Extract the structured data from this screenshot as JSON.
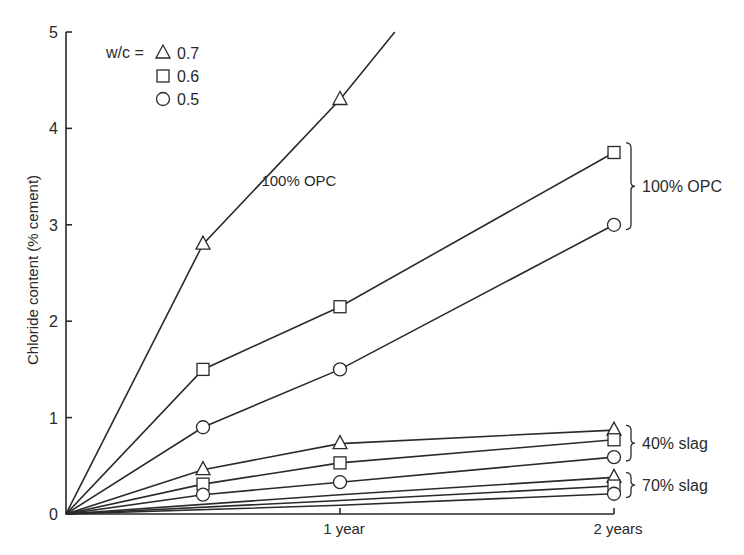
{
  "chart_data": {
    "type": "line",
    "title": "",
    "xlabel": "",
    "ylabel": "Chloride content (% cement)",
    "xlim": [
      0,
      2
    ],
    "ylim": [
      0,
      5
    ],
    "grid": false,
    "x_ticks": [
      {
        "value": 1,
        "label": "1 year"
      },
      {
        "value": 2,
        "label": "2 years"
      }
    ],
    "y_ticks": [
      {
        "value": 0,
        "label": "0"
      },
      {
        "value": 1,
        "label": "1"
      },
      {
        "value": 2,
        "label": "2"
      },
      {
        "value": 3,
        "label": "3"
      },
      {
        "value": 4,
        "label": "4"
      },
      {
        "value": 5,
        "label": "5"
      }
    ],
    "legend": {
      "position": "upper-left",
      "prefix": "w/c =",
      "entries": [
        {
          "marker": "triangle",
          "label": "0.7"
        },
        {
          "marker": "square",
          "label": "0.6"
        },
        {
          "marker": "circle",
          "label": "0.5"
        }
      ]
    },
    "series": [
      {
        "name": "100% OPC, w/c 0.7",
        "group": "100% OPC",
        "wc": "0.7",
        "marker": "triangle",
        "x": [
          0,
          0.5,
          1,
          1.2
        ],
        "y": [
          0,
          2.8,
          4.3,
          5.0
        ],
        "marker_points": [
          1,
          2
        ]
      },
      {
        "name": "100% OPC, w/c 0.6",
        "group": "100% OPC",
        "wc": "0.6",
        "marker": "square",
        "x": [
          0,
          0.5,
          1,
          2
        ],
        "y": [
          0,
          1.5,
          2.15,
          3.75
        ],
        "marker_points": [
          1,
          2,
          3
        ]
      },
      {
        "name": "100% OPC, w/c 0.5",
        "group": "100% OPC",
        "wc": "0.5",
        "marker": "circle",
        "x": [
          0,
          0.5,
          1,
          2
        ],
        "y": [
          0,
          0.9,
          1.5,
          3.0
        ],
        "marker_points": [
          1,
          2,
          3
        ]
      },
      {
        "name": "40% slag, w/c 0.7",
        "group": "40% slag",
        "wc": "0.7",
        "marker": "triangle",
        "x": [
          0,
          0.5,
          1,
          2
        ],
        "y": [
          0,
          0.46,
          0.73,
          0.87
        ],
        "marker_points": [
          1,
          2,
          3
        ]
      },
      {
        "name": "40% slag, w/c 0.6",
        "group": "40% slag",
        "wc": "0.6",
        "marker": "square",
        "x": [
          0,
          0.5,
          1,
          2
        ],
        "y": [
          0,
          0.31,
          0.53,
          0.77
        ],
        "marker_points": [
          1,
          2,
          3
        ]
      },
      {
        "name": "40% slag, w/c 0.5",
        "group": "40% slag",
        "wc": "0.5",
        "marker": "circle",
        "x": [
          0,
          0.5,
          1,
          2
        ],
        "y": [
          0,
          0.2,
          0.33,
          0.59
        ],
        "marker_points": [
          1,
          2,
          3
        ]
      },
      {
        "name": "70% slag, w/c 0.7",
        "group": "70% slag",
        "wc": "0.7",
        "marker": "triangle",
        "x": [
          0,
          1,
          2
        ],
        "y": [
          0,
          0.2,
          0.38
        ],
        "marker_points": [
          2
        ]
      },
      {
        "name": "70% slag, w/c 0.6",
        "group": "70% slag",
        "wc": "0.6",
        "marker": "square",
        "x": [
          0,
          1,
          2
        ],
        "y": [
          0,
          0.14,
          0.29
        ],
        "marker_points": [
          2
        ]
      },
      {
        "name": "70% slag, w/c 0.5",
        "group": "70% slag",
        "wc": "0.5",
        "marker": "circle",
        "x": [
          0,
          1,
          2
        ],
        "y": [
          0,
          0.09,
          0.21
        ],
        "marker_points": [
          2
        ]
      }
    ],
    "annotations": [
      {
        "text": "100% OPC",
        "type": "inline",
        "x": 0.85,
        "y": 3.4
      },
      {
        "text": "100% OPC",
        "type": "brace",
        "y_range": [
          2.95,
          3.85
        ]
      },
      {
        "text": "40% slag",
        "type": "brace",
        "y_range": [
          0.55,
          0.92
        ]
      },
      {
        "text": "70% slag",
        "type": "brace",
        "y_range": [
          0.17,
          0.43
        ]
      }
    ]
  }
}
